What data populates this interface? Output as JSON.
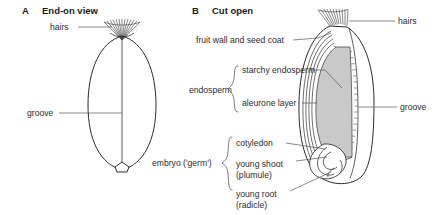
{
  "figure": {
    "background_color": "#ffffff",
    "line_color": "#2a2a2a",
    "leader_color": "#58585a",
    "endosperm_fill": "#c9c9c9"
  },
  "panels": [
    {
      "letter": "A",
      "title": "End-on view",
      "labels": [
        {
          "key": "hairs",
          "text": "hairs"
        },
        {
          "key": "groove",
          "text": "groove"
        }
      ]
    },
    {
      "letter": "B",
      "title": "Cut open",
      "labels": [
        {
          "key": "hairs",
          "text": "hairs"
        },
        {
          "key": "fruit_wall",
          "text": "fruit wall and seed coat"
        },
        {
          "key": "groove",
          "text": "groove"
        },
        {
          "key": "cotyledon",
          "text": "cotyledon"
        }
      ],
      "groups": [
        {
          "key": "endosperm",
          "name": "endosperm",
          "items": [
            {
              "key": "starchy_endosperm",
              "text": "starchy endosperm"
            },
            {
              "key": "aleurone_layer",
              "text": "aleurone layer"
            }
          ]
        },
        {
          "key": "embryo",
          "name": "embryo ('germ')",
          "items": [
            {
              "key": "cotyledon",
              "text": "cotyledon"
            },
            {
              "key": "young_shoot",
              "text": "young shoot"
            },
            {
              "key": "plumule",
              "text": "(plumule)"
            },
            {
              "key": "young_root",
              "text": "young root"
            },
            {
              "key": "radicle",
              "text": "(radicle)"
            }
          ]
        }
      ]
    }
  ]
}
